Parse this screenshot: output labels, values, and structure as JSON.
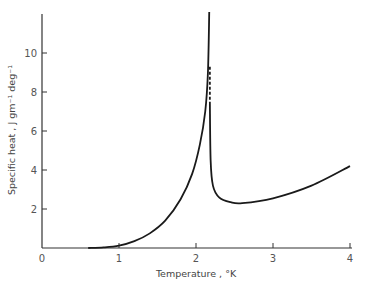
{
  "chart_data": {
    "type": "line",
    "title": "",
    "xlabel": "Temperature , °K",
    "ylabel": "Specific heat , J gm⁻¹ deg⁻¹",
    "xlim": [
      0,
      4
    ],
    "ylim": [
      0,
      12
    ],
    "x_ticks": [
      "0",
      "1",
      "2",
      "3",
      "4"
    ],
    "y_ticks": [
      "2",
      "4",
      "6",
      "8",
      "10"
    ],
    "grid": false,
    "legend": null,
    "series": [
      {
        "name": "below lambda point",
        "style": "solid",
        "x": [
          0.6,
          0.8,
          1.0,
          1.2,
          1.4,
          1.6,
          1.8,
          1.95,
          2.05,
          2.12,
          2.155,
          2.172
        ],
        "y": [
          0.0,
          0.03,
          0.12,
          0.35,
          0.75,
          1.4,
          2.5,
          3.8,
          5.3,
          7.0,
          9.0,
          12.1
        ]
      },
      {
        "name": "discontinuity (dashed)",
        "style": "dashed",
        "x": [
          2.18,
          2.18
        ],
        "y": [
          9.3,
          7.6
        ]
      },
      {
        "name": "above lambda point",
        "style": "solid",
        "x": [
          2.18,
          2.19,
          2.22,
          2.3,
          2.45,
          2.6,
          3.0,
          3.5,
          4.0
        ],
        "y": [
          7.5,
          4.5,
          3.2,
          2.6,
          2.35,
          2.3,
          2.55,
          3.2,
          4.2
        ]
      }
    ]
  }
}
